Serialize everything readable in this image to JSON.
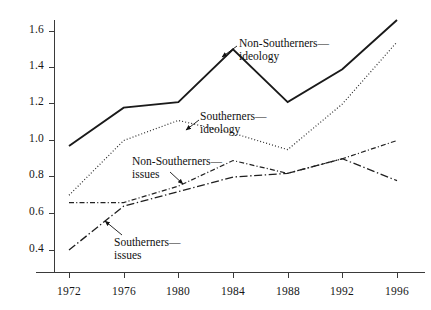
{
  "chart_data": {
    "type": "line",
    "title": "",
    "subtitle": "",
    "xlabel": "",
    "ylabel": "",
    "x": [
      1972,
      1976,
      1980,
      1984,
      1988,
      1992,
      1996
    ],
    "xticklabels": [
      "1972",
      "1976",
      "1980",
      "1984",
      "1988",
      "1992",
      "1996"
    ],
    "yticklabels": [
      "0.4",
      "0.6",
      "0.8",
      "1.0",
      "1.2",
      "1.4",
      "1.6"
    ],
    "yticks": [
      0.4,
      0.6,
      0.8,
      1.0,
      1.2,
      1.4,
      1.6
    ],
    "xlim": [
      1972,
      1996
    ],
    "ylim": [
      0.33,
      1.68
    ],
    "grid": false,
    "legend_position": "inline-annotations",
    "series": [
      {
        "name": "Non-Southerners—ideology",
        "label_line1": "Non-Southerners—",
        "label_line2": "ideology",
        "style": "solid",
        "color": "#1a1a1a",
        "width": 1.9,
        "values": [
          0.97,
          1.18,
          1.21,
          1.5,
          1.21,
          1.39,
          1.66
        ]
      },
      {
        "name": "Southerners—ideology",
        "label_line1": "Southerners—",
        "label_line2": "ideology",
        "style": "dotted",
        "color": "#2b2b2b",
        "width": 1.2,
        "values": [
          0.7,
          1.0,
          1.11,
          1.04,
          0.95,
          1.2,
          1.54
        ]
      },
      {
        "name": "Non-Southerners—issues",
        "label_line1": "Non-Southerners—",
        "label_line2": "issues",
        "style": "dash-dot-fine",
        "color": "#222222",
        "width": 1.2,
        "values": [
          0.66,
          0.66,
          0.75,
          0.89,
          0.82,
          0.9,
          1.0
        ]
      },
      {
        "name": "Southerners—issues",
        "label_line1": "Southerners—",
        "label_line2": "issues",
        "style": "dash-dot-long",
        "color": "#1f1f1f",
        "width": 1.3,
        "values": [
          0.4,
          0.64,
          0.72,
          0.8,
          0.82,
          0.9,
          0.78
        ]
      }
    ],
    "annotations": [
      {
        "series": "Non-Southerners—ideology",
        "text_line1": "Non-Southerners—",
        "text_line2": "ideology",
        "text_x": 239,
        "text_y": 37,
        "arrow_from_x": 237,
        "arrow_from_y": 46,
        "arrow_to_x": 222,
        "arrow_to_y": 57
      },
      {
        "series": "Southerners—ideology",
        "text_line1": "Southerners—",
        "text_line2": "ideology",
        "text_x": 200,
        "text_y": 110,
        "arrow_from_x": 199,
        "arrow_from_y": 120,
        "arrow_to_x": 186,
        "arrow_to_y": 130
      },
      {
        "series": "Non-Southerners—issues",
        "text_line1": "Non-Southerners—",
        "text_line2": "issues",
        "text_x": 132,
        "text_y": 155,
        "arrow_from_x": 170,
        "arrow_from_y": 172,
        "arrow_to_x": 183,
        "arrow_to_y": 184
      },
      {
        "series": "Southerners—issues",
        "text_line1": "Southerners—",
        "text_line2": "issues",
        "text_x": 114,
        "text_y": 236,
        "arrow_from_x": 122,
        "arrow_from_y": 235,
        "arrow_to_x": 105,
        "arrow_to_y": 221
      }
    ]
  },
  "axes": {
    "y_ticks": [
      {
        "label": "1.6",
        "y": 31
      },
      {
        "label": "1.4",
        "y": 67
      },
      {
        "label": "1.2",
        "y": 103
      },
      {
        "label": "1.0",
        "y": 140
      },
      {
        "label": "0.8",
        "y": 176
      },
      {
        "label": "0.6",
        "y": 213
      },
      {
        "label": "0.4",
        "y": 250
      }
    ],
    "x_ticks": [
      {
        "label": "1972",
        "x": 69
      },
      {
        "label": "1976",
        "x": 124
      },
      {
        "label": "1980",
        "x": 178
      },
      {
        "label": "1984",
        "x": 233
      },
      {
        "label": "1988",
        "x": 288
      },
      {
        "label": "1992",
        "x": 342
      },
      {
        "label": "1996",
        "x": 397
      }
    ]
  }
}
